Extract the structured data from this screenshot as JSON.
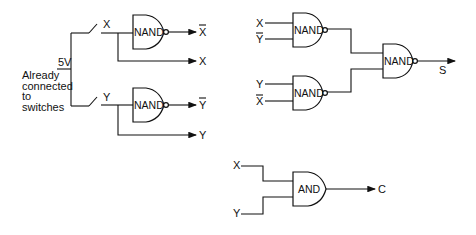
{
  "left_circuit": {
    "supply_label": "5V",
    "note_lines": [
      "Already",
      "connected",
      "to",
      "switches"
    ],
    "switch_x_label": "X",
    "switch_y_label": "Y",
    "gate_top_label": "NAND",
    "gate_bottom_label": "NAND",
    "out_x_bar": "X",
    "out_x": "X",
    "out_y_bar": "Y",
    "out_y": "Y"
  },
  "sum_circuit": {
    "gate1_inputs": [
      "X",
      "Y"
    ],
    "gate1_label": "NAND",
    "gate2_inputs": [
      "Y",
      "X"
    ],
    "gate2_label": "NAND",
    "gate3_label": "NAND",
    "output_label": "S"
  },
  "carry_circuit": {
    "inputs": [
      "X",
      "Y"
    ],
    "gate_label": "AND",
    "output_label": "C"
  }
}
